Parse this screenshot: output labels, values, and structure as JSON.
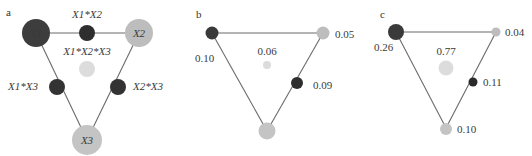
{
  "colors": {
    "dark": "#3a3a3a",
    "mid_dark": "#2e2e2e",
    "light": "#bdbdbd",
    "very_light": "#dcdcdc",
    "edge": "#6b6b6b"
  },
  "panels": [
    {
      "id": "a",
      "label": "a",
      "nodes": {
        "x1": {
          "label": "X1"
        },
        "x2": {
          "label": "X2"
        },
        "x3": {
          "label": "X3"
        },
        "x1x2": {
          "label": "X1*X2"
        },
        "x1x2x3": {
          "label": "X1*X2*X3"
        },
        "x1x3": {
          "label": "X1*X3"
        },
        "x2x3": {
          "label": "X2*X3"
        }
      }
    },
    {
      "id": "b",
      "label": "b",
      "values": {
        "x1": "0.10",
        "x2": "0.05",
        "x1x2x3": "0.06",
        "x2x3": "0.09"
      }
    },
    {
      "id": "c",
      "label": "c",
      "values": {
        "x1": "0.26",
        "x2": "0.04",
        "x1x2x3": "0.77",
        "x2x3": "0.11",
        "x3": "0.10"
      }
    }
  ]
}
